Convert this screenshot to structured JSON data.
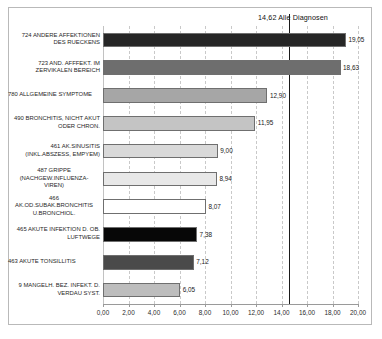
{
  "chart_data": {
    "type": "bar",
    "orientation": "horizontal",
    "title": "",
    "xlabel": "",
    "ylabel": "",
    "xlim": [
      0,
      20
    ],
    "xticks": [
      "0,00",
      "2,00",
      "4,00",
      "6,00",
      "8,00",
      "10,00",
      "12,00",
      "14,00",
      "16,00",
      "18,00",
      "20,00"
    ],
    "xtick_values": [
      0,
      2,
      4,
      6,
      8,
      10,
      12,
      14,
      16,
      18,
      20
    ],
    "grid": true,
    "legend": "none",
    "categories": [
      "724 ANDERE AFFEKTIONEN\nDES RUECKENS",
      "723 AND. AFFFEKT. IM\nZERVIKALEN BEREICH",
      "780 ALLGEMEINE SYMPTOME",
      "490 BRONCHITIS, NICHT AKUT\nODER CHRON.",
      "461 AK.SINUSITIS\n(INKL.ABSZESS, EMPYEM)",
      "487 GRIPPE\n(NACHGEW.INFLUENZA-\nVIREN)",
      "466\nAK.OD.SUBAK.BRONCHITIS\nU.BRONCHIOL.",
      "465 AKUTE INFEKTION D. OB.\nLUFTWEGE",
      "463 AKUTE TONSILLITIS",
      "9 MANGELH. BEZ. INFEKT. D.\nVERDAU SYST."
    ],
    "values": [
      19.05,
      18.63,
      12.9,
      11.95,
      9.0,
      8.94,
      8.07,
      7.38,
      7.12,
      6.05
    ],
    "value_labels": [
      "19,05",
      "18,63",
      "12,90",
      "11,95",
      "9,00",
      "8,94",
      "8,07",
      "7,38",
      "7,12",
      "6,05"
    ],
    "bar_colors": [
      "#262626",
      "#6e6e6e",
      "#a6a6a6",
      "#c4c4c4",
      "#d9d9d9",
      "#e8e8e8",
      "#ffffff",
      "#070707",
      "#4a4a4a",
      "#bdbdbd"
    ],
    "annotations": [
      {
        "name": "average-reference-line",
        "value": 14.62,
        "label": "14,62 Alle Diagnosen",
        "color": "#1a1a1a"
      }
    ]
  },
  "colors": {
    "frame_border": "#b9b9b9",
    "gridline": "#c9c9c9",
    "axis": "#9a9a9a",
    "text": "#1f1f1f",
    "reference_line": "#1a1a1a"
  }
}
